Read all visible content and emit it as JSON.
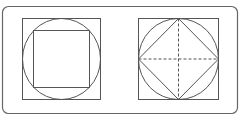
{
  "diagram": {
    "title": "",
    "colors": {
      "stroke": "#555555",
      "frame": "#666666",
      "background": "#ffffff"
    },
    "figures": [
      {
        "name": "circle-inscribed-in-square-with-inner-square",
        "shapes": [
          "outer-square",
          "circle",
          "inner-square"
        ]
      },
      {
        "name": "circle-inscribed-in-square-with-diamond-and-diagonals",
        "shapes": [
          "outer-square",
          "circle",
          "diamond",
          "dashed-cross"
        ]
      }
    ]
  }
}
